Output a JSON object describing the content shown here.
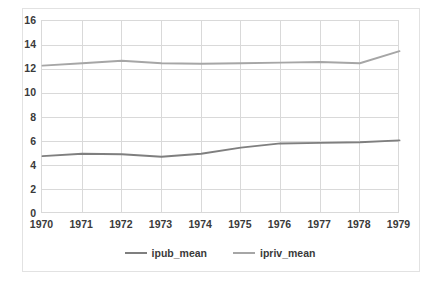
{
  "chart_data": {
    "type": "line",
    "title": "",
    "xlabel": "",
    "ylabel": "",
    "x": [
      1970,
      1971,
      1972,
      1973,
      1974,
      1975,
      1976,
      1977,
      1978,
      1979
    ],
    "categories": [
      "1970",
      "1971",
      "1972",
      "1973",
      "1974",
      "1975",
      "1976",
      "1977",
      "1978",
      "1979"
    ],
    "series": [
      {
        "name": "ipub_mean",
        "color": "#7f7f7f",
        "values": [
          4.8,
          5.0,
          4.95,
          4.75,
          5.0,
          5.5,
          5.85,
          5.9,
          5.95,
          6.1
        ]
      },
      {
        "name": "ipriv_mean",
        "color": "#a6a6a6",
        "values": [
          12.3,
          12.5,
          12.7,
          12.5,
          12.45,
          12.5,
          12.55,
          12.6,
          12.5,
          13.5
        ]
      }
    ],
    "ylim": [
      0,
      16
    ],
    "yticks": [
      0,
      2,
      4,
      6,
      8,
      10,
      12,
      14,
      16
    ],
    "ytick_labels": [
      "0",
      "2",
      "4",
      "6",
      "8",
      "10",
      "12",
      "14",
      "16"
    ],
    "xlim": [
      1970,
      1979
    ],
    "grid": "horizontal-and-vertical",
    "legend_position": "bottom-center",
    "plot_background": "#ffffff",
    "gridline_color": "#d9d9d9",
    "text_color": "#3a3a3a"
  },
  "legend": {
    "entries": [
      {
        "label": "ipub_mean"
      },
      {
        "label": "ipriv_mean"
      }
    ]
  },
  "axis": {
    "y_ticks": [
      {
        "label": "16"
      },
      {
        "label": "14"
      },
      {
        "label": "12"
      },
      {
        "label": "10"
      },
      {
        "label": "8"
      },
      {
        "label": "6"
      },
      {
        "label": "4"
      },
      {
        "label": "2"
      },
      {
        "label": "0"
      }
    ],
    "x_ticks": [
      {
        "label": "1970"
      },
      {
        "label": "1971"
      },
      {
        "label": "1972"
      },
      {
        "label": "1973"
      },
      {
        "label": "1974"
      },
      {
        "label": "1975"
      },
      {
        "label": "1976"
      },
      {
        "label": "1977"
      },
      {
        "label": "1978"
      },
      {
        "label": "1979"
      }
    ]
  }
}
